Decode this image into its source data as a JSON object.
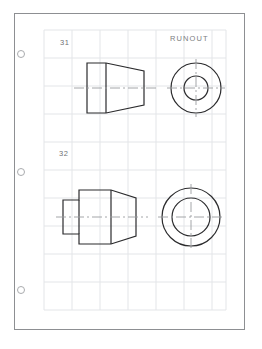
{
  "page": {
    "title": "RUNOUT",
    "background_color": "#ffffff",
    "sheet_color": "#ffffff",
    "sheet_border_color": "#8d8f92",
    "grid_color": "#e3e5e8",
    "line_color": "#2b2b2d",
    "centerline_color": "#9a9c9f",
    "label_color": "#6f7174"
  },
  "binder": {
    "holes": [
      {
        "name": "punch-hole-top",
        "y": 50
      },
      {
        "name": "punch-hole-middle",
        "y": 168
      },
      {
        "name": "punch-hole-bottom",
        "y": 286
      }
    ]
  },
  "grid": {
    "left": 44,
    "top": 30,
    "right": 226,
    "bottom": 310,
    "cell_width": 28,
    "cell_height": 28,
    "columns": 7,
    "rows": 10
  },
  "problems": [
    {
      "number": "31",
      "label_name": "part-label-31",
      "description": "Truncated cone with cylindrical collar, front view and end view",
      "front_view": {
        "name": "part-31-front-view",
        "axis_y": 88,
        "collar_left_x": 87,
        "collar_right_x": 106,
        "collar_top_y": 63,
        "collar_bottom_y": 113,
        "cone_right_x": 144,
        "cone_top_y": 71,
        "cone_bottom_y": 105
      },
      "end_view": {
        "name": "part-31-end-view",
        "center_x": 196,
        "center_y": 88,
        "outer_radius": 25,
        "inner_radius": 12,
        "centerline_extension": 9
      }
    },
    {
      "number": "32",
      "label_name": "part-label-32",
      "description": "Stepped boss with tapered body, front view and end view",
      "front_view": {
        "name": "part-32-front-view",
        "axis_y": 217,
        "boss_left_x": 63,
        "boss_right_x": 79,
        "boss_top_y": 200,
        "boss_bottom_y": 234,
        "body_left_x": 79,
        "body_top_y": 190,
        "body_bottom_y": 244,
        "body_mid_x": 111,
        "body_right_x": 136,
        "taper_top_y": 198,
        "taper_bottom_y": 236
      },
      "end_view": {
        "name": "part-32-end-view",
        "center_x": 191,
        "center_y": 217,
        "outer_radius": 29,
        "inner_radius": 19,
        "centerline_extension": 10
      }
    }
  ]
}
